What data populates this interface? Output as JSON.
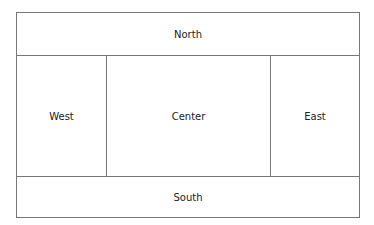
{
  "regions": {
    "north": "North",
    "west": "West",
    "center": "Center",
    "east": "East",
    "south": "South"
  }
}
